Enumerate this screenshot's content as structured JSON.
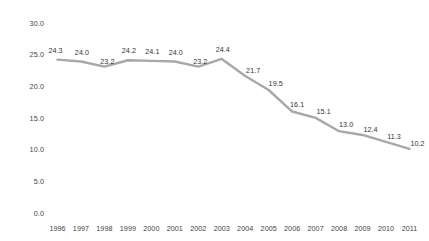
{
  "chart_data": {
    "type": "line",
    "title": "",
    "subtitle": "",
    "xlabel": "",
    "ylabel": "",
    "categories": [
      "1996",
      "1997",
      "1998",
      "1999",
      "2000",
      "2001",
      "2002",
      "2003",
      "2004",
      "2005",
      "2006",
      "2007",
      "2008",
      "2009",
      "2010",
      "2011"
    ],
    "values": [
      24.3,
      24.0,
      23.2,
      24.2,
      24.1,
      24.0,
      23.2,
      24.4,
      21.7,
      19.5,
      16.1,
      15.1,
      13.0,
      12.4,
      11.3,
      10.2
    ],
    "series": [
      {
        "name": "",
        "values": [
          24.3,
          24.0,
          23.2,
          24.2,
          24.1,
          24.0,
          23.2,
          24.4,
          21.7,
          19.5,
          16.1,
          15.1,
          13.0,
          12.4,
          11.3,
          10.2
        ]
      }
    ],
    "point_labels": [
      "24.3",
      "24.0",
      "23.2",
      "24.2",
      "24.1",
      "24.0",
      "23.2",
      "24.4",
      "21.7",
      "19.5",
      "16.1",
      "15.1",
      "13.0",
      "12.4",
      "11.3",
      "10.2"
    ],
    "ylim": [
      0.0,
      30.0
    ],
    "ytick_step": 5.0,
    "ytick_labels": [
      "30.0",
      "25.0",
      "20.0",
      "15.0",
      "10.0",
      "5.0",
      "0.0"
    ],
    "ytick_values": [
      30.0,
      25.0,
      20.0,
      15.0,
      10.0,
      5.0,
      0.0
    ],
    "xtick_labels": [
      "1996",
      "1997",
      "1998",
      "1999",
      "2000",
      "2001",
      "2002",
      "2003",
      "2004",
      "2005",
      "2006",
      "2007",
      "2008",
      "2009",
      "2010",
      "2011"
    ],
    "grid": false,
    "legend": false,
    "legend_position": "none",
    "data_labels_shown": true,
    "markers": false,
    "colors": {
      "line": "#a8a8a8",
      "tick_text": "#3f3f3f",
      "label_text": "#333333",
      "background": "#ffffff"
    }
  }
}
